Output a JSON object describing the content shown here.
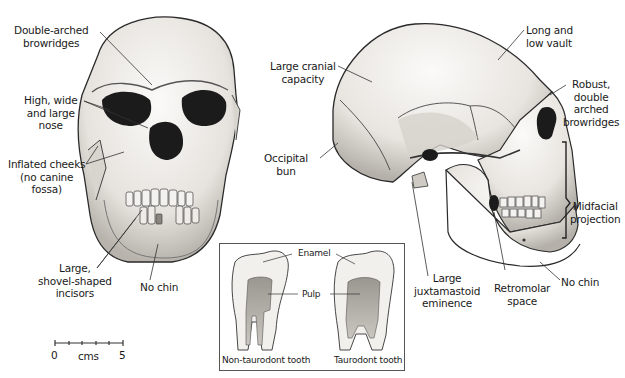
{
  "frontal_view": {
    "labels": {
      "browridges": [
        "Double-arched",
        "browridges"
      ],
      "nose": [
        "High, wide",
        "and large",
        "nose"
      ],
      "cheeks": [
        "Inflated cheeks",
        "(no canine",
        "fossa)"
      ],
      "incisors": [
        "Large,",
        "shovel-shaped",
        "incisors"
      ],
      "chin": "No chin"
    }
  },
  "lateral_view": {
    "labels": {
      "cranial": [
        "Large cranial",
        "capacity"
      ],
      "occipital": [
        "Occipital",
        "bun"
      ],
      "vault": [
        "Long and",
        "low vault"
      ],
      "browridges": [
        "Robust,",
        "double",
        "arched",
        "browridges"
      ],
      "midfacial": [
        "Midfacial",
        "projection"
      ],
      "juxtamastoid": [
        "Large",
        "juxtamastoid",
        "eminence"
      ],
      "retromolar": [
        "Retromolar",
        "space"
      ],
      "chin": "No chin"
    }
  },
  "teeth_inset": {
    "enamel": "Enamel",
    "pulp": "Pulp",
    "left_caption": "Non-taurodont tooth",
    "right_caption": "Taurodont tooth"
  },
  "scale_bar": {
    "start": "0",
    "unit": "cms",
    "end": "5"
  },
  "colors": {
    "bone": "#f2f0ec",
    "bone_shade": "#bdb9b2",
    "outline": "#2a2a2a",
    "socket": "#1b1b1b"
  }
}
